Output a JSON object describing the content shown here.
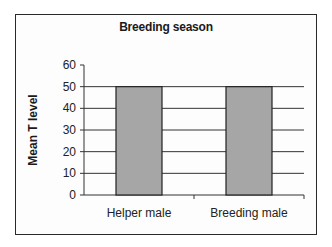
{
  "chart_data": {
    "type": "bar",
    "title": "Breeding season",
    "xlabel": "",
    "ylabel": "Mean T level",
    "categories": [
      "Helper male",
      "Breeding male"
    ],
    "values": [
      50,
      50
    ],
    "ylim": [
      0,
      60
    ],
    "yticks": [
      0,
      10,
      20,
      30,
      40,
      50,
      60
    ],
    "grid": true,
    "legend": null,
    "bar_color": "#a6a6a6",
    "bar_edge_color": "#222222"
  }
}
